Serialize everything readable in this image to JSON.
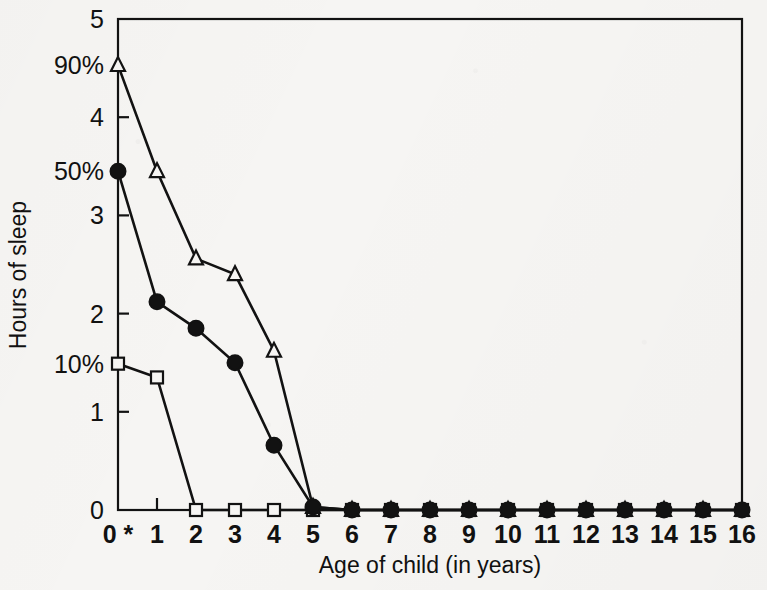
{
  "figure": {
    "background_color": "#f6f5f3",
    "ink_color": "#121212"
  },
  "chart_data": {
    "type": "line",
    "title": "",
    "xlabel": "Age of child  (in years)",
    "ylabel": "Hours of sleep",
    "x": [
      0,
      1,
      2,
      3,
      4,
      5,
      6,
      7,
      8,
      9,
      10,
      11,
      12,
      13,
      14,
      15,
      16
    ],
    "xtick_labels": [
      "0 *",
      "1",
      "2",
      "3",
      "4",
      "5",
      "6",
      "7",
      "8",
      "9",
      "10",
      "11",
      "12",
      "13",
      "14",
      "15",
      "16"
    ],
    "xlim": [
      0,
      16
    ],
    "ylim": [
      0,
      5
    ],
    "ytick_values": [
      0,
      1,
      2,
      3,
      4,
      5
    ],
    "ytick_labels": [
      "0",
      "1",
      "2",
      "3",
      "4",
      "5"
    ],
    "grid": false,
    "legend_position": "none",
    "secondary_axis_labels": [
      {
        "text": "90%",
        "value": 4.53
      },
      {
        "text": "50%",
        "value": 3.45
      },
      {
        "text": "10%",
        "value": 1.49
      }
    ],
    "series": [
      {
        "name": "90th percentile",
        "marker": "triangle-open",
        "values": [
          4.53,
          3.45,
          2.56,
          2.4,
          1.62,
          0.03,
          0,
          0,
          0,
          0,
          0,
          0,
          0,
          0,
          0,
          0,
          0
        ]
      },
      {
        "name": "50th percentile",
        "marker": "circle-filled",
        "values": [
          3.45,
          2.12,
          1.85,
          1.5,
          0.66,
          0.03,
          0,
          0,
          0,
          0,
          0,
          0,
          0,
          0,
          0,
          0,
          0
        ]
      },
      {
        "name": "10th percentile",
        "marker": "square-open",
        "values": [
          1.49,
          1.35,
          0,
          0,
          0,
          0,
          0,
          0,
          0,
          0,
          0,
          0,
          0,
          0,
          0,
          0,
          0
        ]
      }
    ],
    "footnote_marker": "*"
  }
}
